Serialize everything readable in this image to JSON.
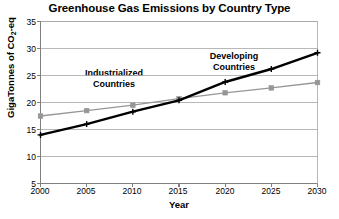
{
  "chart_data": {
    "type": "line",
    "title": "Greenhouse Gas Emissions by Country Type",
    "xlabel": "Year",
    "ylabel": "GigaTonnes of CO2-eq",
    "ylabel_prefix": "GigaTonnes of CO",
    "ylabel_sub": "2",
    "ylabel_suffix": "-eq",
    "x": [
      2000,
      2005,
      2010,
      2015,
      2020,
      2025,
      2030
    ],
    "xlim": [
      2000,
      2030
    ],
    "ylim": [
      5,
      35
    ],
    "xticks": [
      "2000",
      "2005",
      "2010",
      "2015",
      "2020",
      "2025",
      "2030"
    ],
    "yticks": [
      "5",
      "10",
      "15",
      "20",
      "25",
      "30",
      "35"
    ],
    "grid": "horizontal",
    "legend": "inline-annotations",
    "series": [
      {
        "name": "Developing Countries",
        "color": "#000000",
        "marker": "plus",
        "line_width": 2.4,
        "values": [
          14.0,
          16.0,
          18.3,
          20.4,
          23.8,
          26.2,
          29.2
        ]
      },
      {
        "name": "Industrialized Countries",
        "color": "#969696",
        "marker": "square",
        "line_width": 1.3,
        "values": [
          17.5,
          18.5,
          19.5,
          20.7,
          21.8,
          22.7,
          23.7
        ]
      }
    ],
    "annotations": [
      {
        "text_line1": "Industrialized",
        "text_line2": "Countries"
      },
      {
        "text_line1": "Developing",
        "text_line2": "Countries"
      }
    ],
    "colors": {
      "background": "#ffffff",
      "axis": "#808080",
      "grid": "#a6a6a6",
      "text": "#000000",
      "series_developing": "#000000",
      "series_industrialized": "#969696"
    }
  }
}
